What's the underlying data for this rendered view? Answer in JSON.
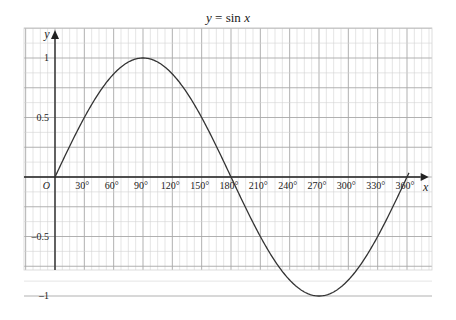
{
  "chart_data": {
    "type": "line",
    "title": "y = sin x",
    "xlabel": "x",
    "ylabel": "y",
    "origin_label": "O",
    "x_ticks": [
      30,
      60,
      90,
      120,
      150,
      180,
      210,
      240,
      270,
      300,
      330,
      360
    ],
    "x_tick_labels": [
      "30°",
      "60°",
      "90°",
      "120°",
      "150°",
      "180°",
      "210°",
      "240°",
      "270°",
      "300°",
      "330°",
      "360°"
    ],
    "y_ticks": [
      1,
      0.5,
      -0.5,
      -1
    ],
    "y_tick_labels": [
      "1",
      "0.5",
      "–0.5",
      "–1"
    ],
    "xlim": [
      -30,
      380
    ],
    "ylim": [
      -1.05,
      1.2
    ],
    "grid": true,
    "series": [
      {
        "name": "sin x",
        "function": "sin",
        "x": [
          0,
          30,
          60,
          90,
          120,
          150,
          180,
          210,
          240,
          270,
          300,
          330,
          360
        ],
        "values": [
          0,
          0.5,
          0.866,
          1,
          0.866,
          0.5,
          0,
          -0.5,
          -0.866,
          -1,
          -0.866,
          -0.5,
          0
        ]
      }
    ],
    "colors": {
      "curve": "#333333",
      "axis": "#222222",
      "grid_minor": "#d4d4d4",
      "grid_major": "#a8a8a8"
    }
  }
}
